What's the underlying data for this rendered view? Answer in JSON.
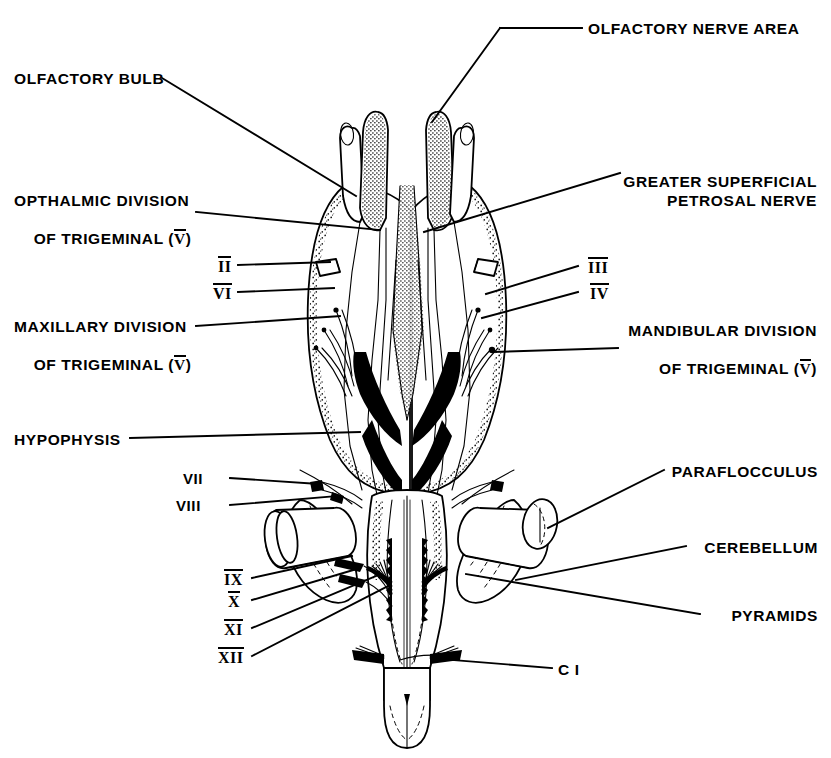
{
  "figure": {
    "background_color": "#ffffff",
    "ink_color": "#000000",
    "width": 831,
    "height": 758
  },
  "labels": {
    "olfactory_nerve_area": "OLFACTORY NERVE AREA",
    "olfactory_bulb": "OLFACTORY BULB",
    "greater_superficial_petrosal_1": "GREATER SUPERFICIAL",
    "greater_superficial_petrosal_2": "PETROSAL NERVE",
    "opthalmic_division_1": "OPTHALMIC DIVISION",
    "opthalmic_division_2a": "OF TRIGEMINAL (",
    "opthalmic_division_2b": "V",
    "opthalmic_division_2c": ")",
    "maxillary_division_1": "MAXILLARY DIVISION",
    "maxillary_division_2a": "OF TRIGEMINAL (",
    "maxillary_division_2b": "V",
    "maxillary_division_2c": ")",
    "mandibular_division_1": "MANDIBULAR DIVISION",
    "mandibular_division_2a": "OF TRIGEMINAL (",
    "mandibular_division_2b": "V",
    "mandibular_division_2c": ")",
    "hypophysis": "HYPOPHYSIS",
    "paraflocculus": "PARAFLOCCULUS",
    "cerebellum": "CEREBELLUM",
    "pyramids": "PYRAMIDS",
    "cervical_one": "C I"
  },
  "cranial_nerves": [
    {
      "numeral": "II",
      "overlined": true,
      "side": "left"
    },
    {
      "numeral": "VI",
      "overlined": true,
      "side": "left"
    },
    {
      "numeral": "III",
      "overlined": true,
      "side": "right"
    },
    {
      "numeral": "IV",
      "overlined": true,
      "side": "right"
    },
    {
      "numeral": "VII",
      "overlined": false,
      "side": "left"
    },
    {
      "numeral": "VIII",
      "overlined": false,
      "side": "left"
    },
    {
      "numeral": "IX",
      "overlined": true,
      "side": "left"
    },
    {
      "numeral": "X",
      "overlined": true,
      "side": "left"
    },
    {
      "numeral": "XI",
      "overlined": true,
      "side": "left"
    },
    {
      "numeral": "XII",
      "overlined": true,
      "side": "left"
    }
  ]
}
